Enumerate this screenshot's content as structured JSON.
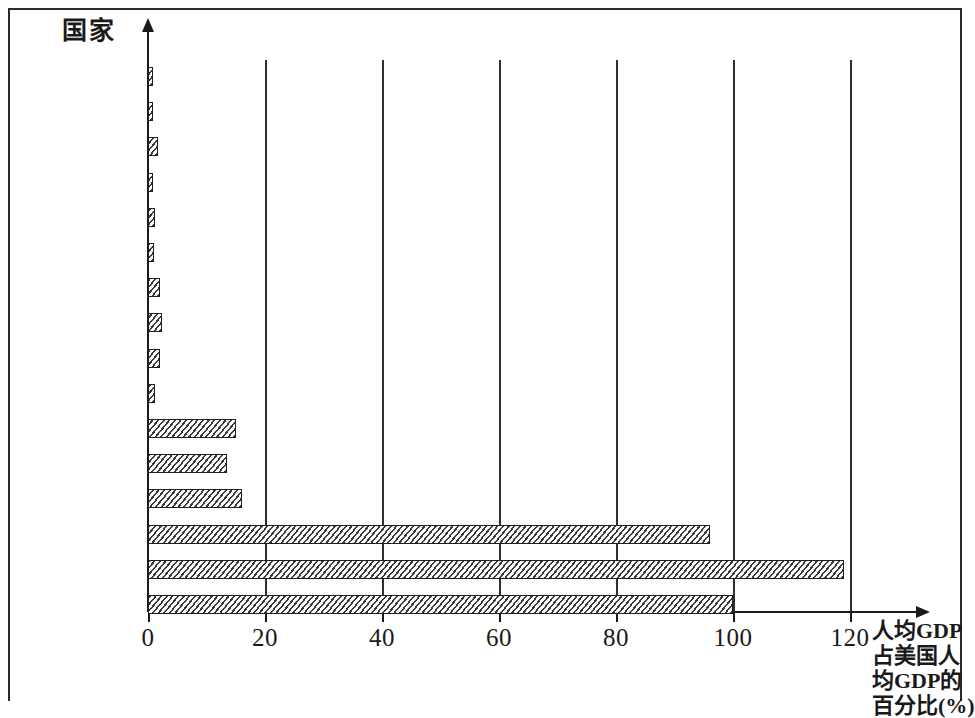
{
  "chart_data": {
    "type": "bar",
    "orientation": "horizontal",
    "title": "",
    "ylabel": "国家",
    "xlabel": "人均GDP占美国人均GDP的百分比(%)",
    "xlabel_lines": [
      "人均GDP",
      "占美国人",
      "均GDP的",
      "百分比(%)"
    ],
    "categories": [
      "埃塞俄比亚",
      "孟加拉国",
      "巴基斯坦",
      "越南",
      "尼日利亚",
      "印度",
      "埃及",
      "菲律宾",
      "印度尼西亚",
      "中国",
      "墨西哥",
      "俄罗斯",
      "巴西",
      "德国",
      "日本",
      "美国"
    ],
    "values": [
      0.8,
      0.9,
      1.7,
      0.8,
      1.2,
      1.1,
      2.0,
      2.4,
      2.1,
      1.2,
      15.0,
      13.5,
      16.0,
      96.0,
      119.0,
      100.0
    ],
    "xlim": [
      0,
      130
    ],
    "xticks": [
      0,
      20,
      40,
      60,
      80,
      100,
      120
    ],
    "xtick_labels": [
      "0",
      "20",
      "40",
      "60",
      "80",
      "100",
      "120"
    ],
    "grid": true,
    "grid_axis": "x",
    "legend": null,
    "bar_fill": "#fbfbfb",
    "bar_edge": "#1f1f1f",
    "axis_color": "#1a1a1a"
  }
}
